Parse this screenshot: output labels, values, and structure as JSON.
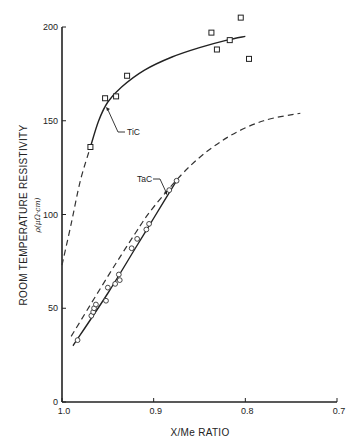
{
  "chart_data": {
    "type": "scatter",
    "title": "",
    "xlabel": "X/Me RATIO",
    "ylabel": "ROOM TEMPERATURE RESISTIVITY",
    "ylabel_units": "ρ(μΩ-cm)",
    "xlim": [
      1.0,
      0.7
    ],
    "ylim": [
      0,
      200
    ],
    "x_reversed": true,
    "grid": false,
    "x_ticks": [
      1.0,
      0.9,
      0.8,
      0.7
    ],
    "x_tick_labels": [
      "1.0",
      "0.9",
      "0.8",
      "0.7"
    ],
    "y_ticks": [
      0,
      50,
      100,
      150,
      200
    ],
    "y_tick_labels": [
      "0",
      "50",
      "100",
      "150",
      "200"
    ],
    "series": [
      {
        "name": "TiC",
        "marker": "square",
        "points": [
          {
            "x": 0.969,
            "y": 136
          },
          {
            "x": 0.953,
            "y": 162
          },
          {
            "x": 0.941,
            "y": 163
          },
          {
            "x": 0.929,
            "y": 174
          },
          {
            "x": 0.837,
            "y": 197
          },
          {
            "x": 0.831,
            "y": 188
          },
          {
            "x": 0.817,
            "y": 193
          },
          {
            "x": 0.805,
            "y": 205
          },
          {
            "x": 0.796,
            "y": 183
          }
        ],
        "fit_solid": [
          [
            0.969,
            136
          ],
          [
            0.96,
            150
          ],
          [
            0.95,
            160
          ],
          [
            0.935,
            168
          ],
          [
            0.91,
            177
          ],
          [
            0.88,
            184
          ],
          [
            0.85,
            189
          ],
          [
            0.82,
            193
          ],
          [
            0.8,
            195
          ]
        ],
        "fit_dashed": [
          [
            1.0,
            73
          ],
          [
            0.99,
            95
          ],
          [
            0.98,
            118
          ],
          [
            0.969,
            136
          ]
        ]
      },
      {
        "name": "TaC",
        "marker": "circle",
        "points": [
          {
            "x": 0.983,
            "y": 33
          },
          {
            "x": 0.968,
            "y": 46
          },
          {
            "x": 0.966,
            "y": 48
          },
          {
            "x": 0.965,
            "y": 50
          },
          {
            "x": 0.963,
            "y": 52
          },
          {
            "x": 0.952,
            "y": 54
          },
          {
            "x": 0.95,
            "y": 61
          },
          {
            "x": 0.942,
            "y": 63
          },
          {
            "x": 0.938,
            "y": 68
          },
          {
            "x": 0.937,
            "y": 65
          },
          {
            "x": 0.924,
            "y": 82
          },
          {
            "x": 0.918,
            "y": 87
          },
          {
            "x": 0.908,
            "y": 92
          },
          {
            "x": 0.905,
            "y": 95
          },
          {
            "x": 0.875,
            "y": 118
          },
          {
            "x": 0.883,
            "y": 113
          }
        ],
        "fit_solid": [
          [
            0.988,
            30
          ],
          [
            0.95,
            58
          ],
          [
            0.92,
            82
          ],
          [
            0.9,
            98
          ],
          [
            0.875,
            118
          ]
        ],
        "fit_dashed": [
          [
            0.99,
            35
          ],
          [
            0.95,
            67
          ],
          [
            0.92,
            90
          ],
          [
            0.9,
            104
          ],
          [
            0.86,
            126
          ],
          [
            0.82,
            141
          ],
          [
            0.78,
            150
          ],
          [
            0.74,
            154
          ]
        ]
      }
    ],
    "annotations": [
      {
        "text": "TiC",
        "x": 0.93,
        "y": 140
      },
      {
        "text": "TaC",
        "x": 0.917,
        "y": 117
      }
    ]
  },
  "labels": {
    "xlabel": "X/Me RATIO",
    "ylabel": "ROOM TEMPERATURE RESISTIVITY",
    "ylabel_units": "ρ(μΩ·cm)",
    "tic": "TiC",
    "tac": "TaC"
  }
}
